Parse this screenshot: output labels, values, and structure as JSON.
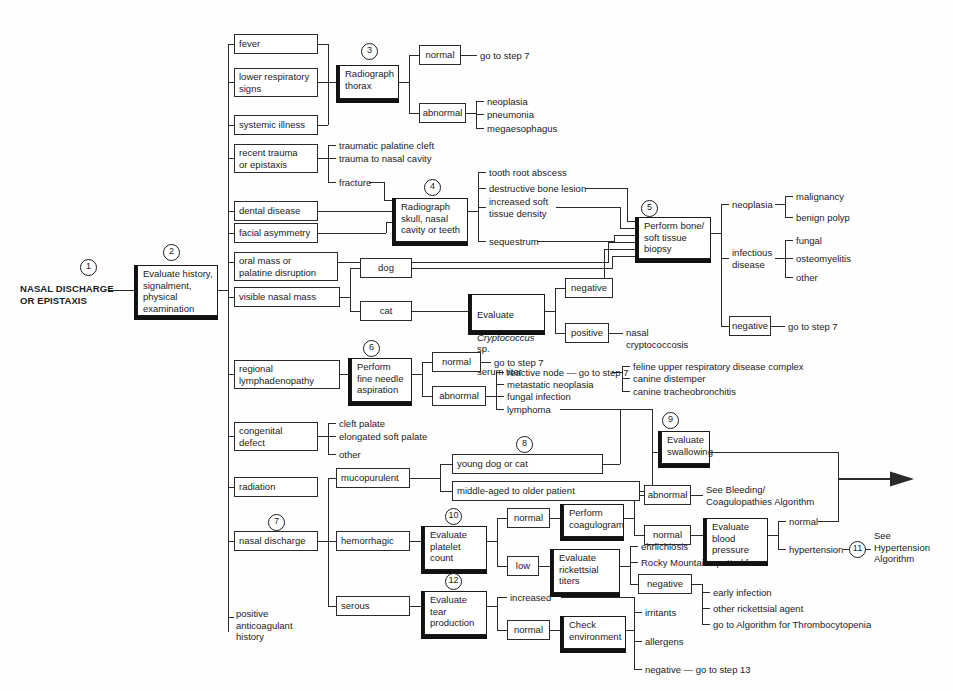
{
  "diagram": {
    "title": "NASAL DISCHARGE OR EPISTAXIS",
    "entry_label": "NASAL DISCHARGE\nOR EPISTAXIS",
    "steps": {
      "s1": "1",
      "s2": "2",
      "s3": "3",
      "s4": "4",
      "s5": "5",
      "s6": "6",
      "s7": "7",
      "s8": "8",
      "s9": "9",
      "s10": "10",
      "s11": "11",
      "s12": "12"
    },
    "nodes": {
      "evaluate_history": "Evaluate history,\nsignalment,\nphysical\nexamination",
      "fever": "fever",
      "lower_respiratory_signs": "lower respiratory\nsigns",
      "systemic_illness": "systemic illness",
      "radiograph_thorax": "Radiograph\nthorax",
      "thorax_normal": "normal",
      "thorax_normal_out": "go to step 7",
      "thorax_abnormal": "abnormal",
      "neoplasia_1": "neoplasia",
      "pneumonia": "pneumonia",
      "megaesophagus": "megaesophagus",
      "recent_trauma": "recent trauma\nor epistaxis",
      "traumatic_palatine_cleft": "traumatic palatine cleft",
      "trauma_nasal_cavity": "trauma to nasal cavity",
      "fracture": "fracture",
      "dental_disease": "dental disease",
      "facial_asymmetry": "facial asymmetry",
      "radiograph_skull": "Radiograph\nskull, nasal\ncavity or teeth",
      "tooth_root_abscess": "tooth root abscess",
      "destructive_bone_lesion": "destructive bone lesion",
      "increased_soft_tissue_density": "increased soft\ntissue density",
      "sequestrum": "sequestrum",
      "oral_mass": "oral mass or\npalatine disruption",
      "perform_biopsy": "Perform bone/\nsoft tissue\nbiopsy",
      "biopsy_neoplasia": "neoplasia",
      "malignancy": "malignancy",
      "benign_polyp": "benign polyp",
      "infectious_disease": "infectious\ndisease",
      "fungal": "fungal",
      "osteomyelitis": "osteomyelitis",
      "other_inf": "other",
      "biopsy_negative": "negative",
      "biopsy_negative_out": "go to step 7",
      "visible_nasal_mass": "visible nasal mass",
      "dog": "dog",
      "cat": "cat",
      "evaluate_crypto": "Evaluate\nCryptococcus sp.\nserum titer",
      "evaluate_crypto_line1": "Evaluate",
      "evaluate_crypto_line2": "Cryptococcus",
      "evaluate_crypto_line2b": " sp.",
      "evaluate_crypto_line3": "serum titer",
      "crypto_negative": "negative",
      "crypto_positive": "positive",
      "nasal_cryptococcosis": "nasal\ncryptococcosis",
      "regional_lymphadenopathy": "regional\nlymphadenopathy",
      "fine_needle": "Perform\nfine needle\naspiration",
      "fna_normal": "normal",
      "fna_normal_out": "go to step 7",
      "fna_abnormal": "abnormal",
      "reactive_node": "reactive node — go to step 7",
      "metastatic_neoplasia": "metastatic neoplasia",
      "fungal_infection": "fungal infection",
      "lymphoma": "lymphoma",
      "congenital_defect": "congenital\ndefect",
      "cleft_palate": "cleft palate",
      "elongated_soft_palate": "elongated soft palate",
      "other_congenital": "other",
      "radiation": "radiation",
      "nasal_discharge": "nasal discharge",
      "positive_anticoagulant": "positive\nanticoagulant\nhistory",
      "mucopurulent": "mucopurulent",
      "young_dog_or_cat": "young dog or cat",
      "middle_aged": "middle-aged to older patient",
      "feline_urd": "feline upper respiratory disease complex",
      "canine_distemper": "canine distemper",
      "canine_tracheobronchitis": "canine tracheobronchitis",
      "evaluate_swallowing": "Evaluate\nswallowing",
      "hemorrhagic": "hemorrhagic",
      "evaluate_platelet": "Evaluate\nplatelet\ncount",
      "platelet_normal": "normal",
      "platelet_low": "low",
      "perform_coagulogram": "Perform\ncoagulogram",
      "coag_abnormal": "abnormal",
      "see_bleeding": "See Bleeding/\nCoagulopathies Algorithm",
      "coag_normal": "normal",
      "evaluate_bp": "Evaluate\nblood\npressure",
      "bp_normal": "normal",
      "bp_hypertension": "hypertension",
      "see_hypertension": "See\nHypertension\nAlgorithm",
      "evaluate_rickettsial": "Evaluate\nrickettsial\ntiters",
      "ehrlichiosis": "ehrlichiosis",
      "rmsf": "Rocky Mountain spotted fever",
      "rick_negative": "negative",
      "early_infection": "early infection",
      "other_rickettsial_agent": "other rickettsial agent",
      "go_to_thrombocytopenia": "go to Algorithm for Thrombocytopenia",
      "serous": "serous",
      "evaluate_tear": "Evaluate\ntear\nproduction",
      "tear_increased": "increased",
      "tear_normal": "normal",
      "check_environment": "Check\nenvironment",
      "irritants": "irritants",
      "allergens": "allergens",
      "env_negative": "negative — go to step 13"
    },
    "colors": {
      "line": "#2a2a2a",
      "text": "#1b1b1b",
      "background": "#fefefe",
      "shadow": "#111111"
    }
  }
}
